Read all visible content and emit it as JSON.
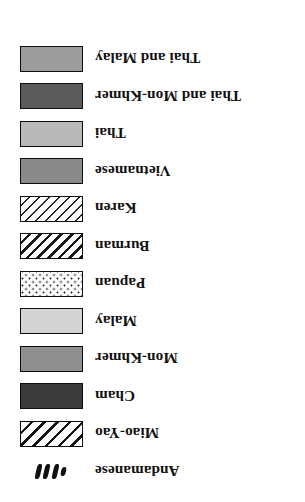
{
  "legend": {
    "title": "",
    "background_color": "#ffffff",
    "border_color": "#0d0d0d",
    "orientation": "rotated-180",
    "items": [
      {
        "label": "Thai and Malay",
        "pattern": "solid",
        "color": "#9d9d9d",
        "swatch_name": "swatch-thai-and-malay"
      },
      {
        "label": "Thai and Mon-Khmer",
        "pattern": "solid",
        "color": "#5a5a5a",
        "swatch_name": "swatch-thai-and-mon-khmer"
      },
      {
        "label": "Thai",
        "pattern": "solid",
        "color": "#b9b9b9",
        "swatch_name": "swatch-thai"
      },
      {
        "label": "Vietnamese",
        "pattern": "solid",
        "color": "#8a8a8a",
        "swatch_name": "swatch-vietnamese"
      },
      {
        "label": "Karen",
        "pattern": "diagonal-hatch-thin",
        "color": "#ffffff",
        "swatch_name": "swatch-karen"
      },
      {
        "label": "Burman",
        "pattern": "diagonal-hatch-medium",
        "color": "#ffffff",
        "swatch_name": "swatch-burman"
      },
      {
        "label": "Papuan",
        "pattern": "dotted",
        "color": "#ffffff",
        "swatch_name": "swatch-papuan"
      },
      {
        "label": "Malay",
        "pattern": "solid",
        "color": "#d3d3d3",
        "swatch_name": "swatch-malay"
      },
      {
        "label": "Mon-Khmer",
        "pattern": "solid",
        "color": "#8f8f8f",
        "swatch_name": "swatch-mon-khmer"
      },
      {
        "label": "Cham",
        "pattern": "solid",
        "color": "#3b3b3b",
        "swatch_name": "swatch-cham"
      },
      {
        "label": "Miao-Yao",
        "pattern": "diagonal-hatch-wide",
        "color": "#ffffff",
        "swatch_name": "swatch-miao-yao"
      },
      {
        "label": "Andamanese",
        "pattern": "dash-marks",
        "color": "#111111",
        "swatch_name": "swatch-andamanese"
      }
    ]
  }
}
